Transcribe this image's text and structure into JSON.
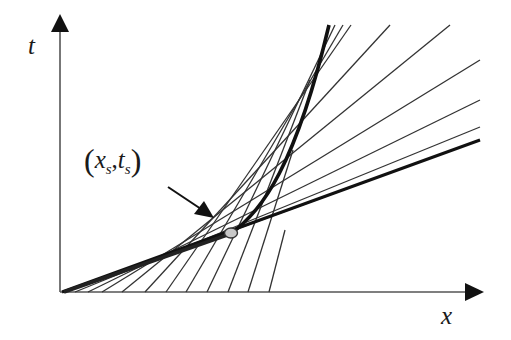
{
  "diagram": {
    "type": "characteristics-envelope",
    "axes": {
      "horizontal": {
        "label": "x"
      },
      "vertical": {
        "label": "t"
      }
    },
    "point": {
      "label_var1": "x",
      "label_sub1": "s",
      "separator": ",",
      "label_var2": "t",
      "label_sub2": "s",
      "open_paren": "(",
      "close_paren": ")",
      "description": "(x_s, t_s)",
      "fill_color": "#c8c8c8"
    },
    "colors": {
      "line": "#333333",
      "thick": "#111111",
      "axis": "#555555",
      "background": "#ffffff"
    },
    "characteristic_lines": [
      {
        "from": [
          65,
          292
        ],
        "to": [
          480,
          140
        ]
      },
      {
        "from": [
          75,
          292
        ],
        "to": [
          480,
          127
        ]
      },
      {
        "from": [
          88,
          292
        ],
        "to": [
          480,
          100
        ]
      },
      {
        "from": [
          102,
          292
        ],
        "to": [
          480,
          60
        ]
      },
      {
        "from": [
          122,
          292
        ],
        "to": [
          450,
          25
        ]
      },
      {
        "from": [
          145,
          292
        ],
        "to": [
          390,
          25
        ]
      },
      {
        "from": [
          166,
          292
        ],
        "to": [
          351,
          25
        ]
      },
      {
        "from": [
          186,
          292
        ],
        "to": [
          343,
          25
        ]
      },
      {
        "from": [
          207,
          292
        ],
        "to": [
          335,
          25
        ]
      },
      {
        "from": [
          228,
          292
        ],
        "to": [
          310,
          80
        ]
      },
      {
        "from": [
          248,
          292
        ],
        "to": [
          293,
          150
        ]
      },
      {
        "from": [
          269,
          292
        ],
        "to": [
          285,
          230
        ]
      }
    ],
    "envelope_curve": "M230,234 C262,212 296,165 329,25",
    "thick_tangent": {
      "from": [
        62,
        292
      ],
      "to": [
        480,
        140
      ]
    },
    "point_xy": [
      230,
      234
    ]
  }
}
